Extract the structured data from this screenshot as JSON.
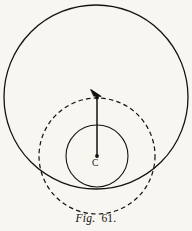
{
  "figure": {
    "caption_prefix": "Fig.",
    "caption_number": "61.",
    "caption_full": "Fig. 61.",
    "background_color": "#f8f6f1",
    "ink_color": "#14120f"
  },
  "labels": {
    "center": "C"
  },
  "chart_data": {
    "type": "diagram",
    "title": "Fig. 61.",
    "units": "pixels",
    "canvas": {
      "width": 192,
      "height": 231
    },
    "elements": [
      {
        "name": "outer-circle",
        "shape": "circle",
        "stroke": "solid",
        "cx": 96,
        "cy": 97,
        "r": 92,
        "stroke_width": 1.3,
        "stroke_color": "#14120f",
        "fill": "none"
      },
      {
        "name": "dashed-circle",
        "shape": "circle",
        "stroke": "dashed",
        "cx": 97,
        "cy": 156,
        "r": 58,
        "stroke_width": 1.2,
        "stroke_color": "#14120f",
        "dash_pattern": "4.5 3.2",
        "fill": "none"
      },
      {
        "name": "inner-circle",
        "shape": "circle",
        "stroke": "solid",
        "cx": 97,
        "cy": 156,
        "r": 31,
        "stroke_width": 1.1,
        "stroke_color": "#14120f",
        "fill": "none"
      },
      {
        "name": "radius-line",
        "shape": "line",
        "stroke": "solid",
        "x1": 97,
        "y1": 156,
        "x2": 97,
        "y2": 98,
        "stroke_width": 1.5,
        "stroke_color": "#14120f",
        "arrowhead_at": "top",
        "endpoint_dots": [
          "top",
          "bottom"
        ]
      }
    ],
    "annotations": [
      {
        "name": "center-label",
        "text": "C",
        "x": 96,
        "y": 164
      },
      {
        "name": "figure-caption",
        "text": "Fig. 61.",
        "x": 96,
        "y": 220
      }
    ]
  }
}
